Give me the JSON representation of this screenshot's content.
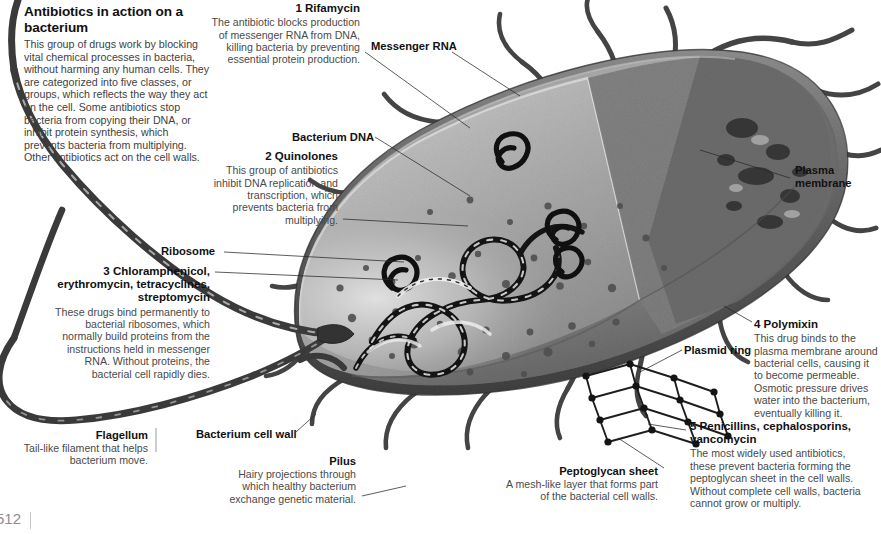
{
  "page": {
    "folio": "512",
    "background_color": "#ffffff",
    "ink_color": "#1a1a1a",
    "body_text_color": "#4a4a4a"
  },
  "intro": {
    "title": "Antibiotics in action on a bacterium",
    "body": "This group of drugs work by blocking vital chemical processes in bacteria, without harming any human cells. They are categorized into five classes, or groups, which reflects the way they act on the cell. Some antibiotics stop bacteria from copying their DNA, or inhibit protein synthesis, which prevents bacteria from multiplying. Other antibiotics act on the cell walls."
  },
  "callouts": [
    {
      "number": "1",
      "title": "Rifamycin",
      "body": "The antibiotic blocks production of messenger RNA from DNA, killing bacteria by preventing essential protein production."
    },
    {
      "number": "2",
      "title": "Quinolones",
      "body": "This group of antibiotics inhibit DNA replication and transcription, which prevents bacteria from multiplying."
    },
    {
      "number": "3",
      "title": "Chloramphenicol, erythromycin, tetracyclines, streptomycin",
      "body": "These drugs bind permanently to bacterial ribosomes, which normally build proteins from the instructions held in messenger RNA. Without proteins, the bacterial cell rapidly dies."
    },
    {
      "number": "4",
      "title": "Polymixin",
      "body": "This drug binds to the plasma membrane around bacterial cells, causing it to become permeable. Osmotic pressure drives water into the bacterium, eventually killing it."
    },
    {
      "number": "5",
      "title": "Penicillins, cephalosporins, vancomycin",
      "body": "The most widely used antibiotics, these prevent bacteria forming the peptoglycan sheet in the cell walls. Without complete cell walls, bacteria cannot grow or multiply."
    }
  ],
  "labels": {
    "messenger_rna": "Messenger RNA",
    "bacterium_dna": "Bacterium DNA",
    "ribosome": "Ribosome",
    "plasma_membrane": "Plasma membrane",
    "plasmid_ring": "Plasmid ring",
    "bacterium_cell_wall": "Bacterium cell wall"
  },
  "captions": [
    {
      "title": "Flagellum",
      "body": "Tail-like filament that helps bacterium move."
    },
    {
      "title": "Pilus",
      "body": "Hairy projections through which healthy bacterium exchange genetic material."
    },
    {
      "title": "Peptoglycan sheet",
      "body": "A mesh-like layer that forms part of the bacterial cell walls."
    }
  ],
  "illustration": {
    "subject": "rod-shaped bacterium cutaway",
    "style": "grayscale scientific airbrush rendering",
    "palette": {
      "cytoplasm_light": "#b9b9b9",
      "cytoplasm_mid": "#9a9a9a",
      "cell_wall": "#6f6f6f",
      "outer_shadow": "#4c4c4c",
      "dna_dark": "#1b1b1b",
      "granule": "#555555",
      "mesh": "#222222"
    },
    "features": [
      "flagellum",
      "pili",
      "bacterium cell wall",
      "plasma membrane",
      "cytoplasm",
      "bacterium DNA strand",
      "plasmid rings",
      "ribosome granules",
      "messenger RNA",
      "peptoglycan mesh sheet"
    ]
  }
}
